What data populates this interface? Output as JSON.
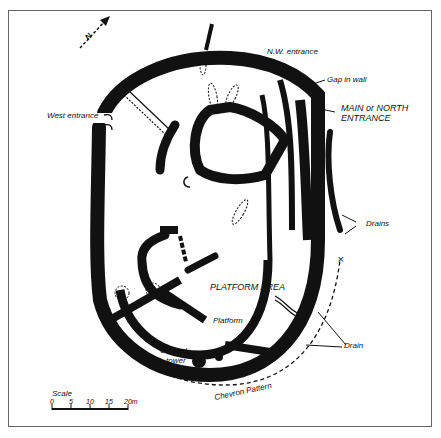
{
  "figure": {
    "type": "archaeological site plan",
    "north_arrow": {
      "label": "N"
    },
    "labels": {
      "nw_entrance": "N.W. entrance",
      "gap_in_wall": "Gap in wall",
      "main_entrance_line1": "MAIN or NORTH",
      "main_entrance_line2": "ENTRANCE",
      "west_entrance": "West entrance",
      "drains": "Drains",
      "platform_area": "PLATFORM AREA",
      "platform": "Platform",
      "conical_tower_line1": "Conical",
      "conical_tower_line2": "tower",
      "drain": "Drain",
      "chevron_pattern": "Chevron Pattern"
    },
    "scale": {
      "title": "Scale",
      "ticks": [
        "0",
        "5",
        "10",
        "15",
        "20m"
      ]
    },
    "colors": {
      "ink": "#111111",
      "paper": "#ffffff",
      "border": "#666666"
    }
  }
}
